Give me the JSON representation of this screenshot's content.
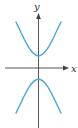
{
  "figure": {
    "type": "hyperbola",
    "orientation": "vertical",
    "equation_form": "y^2/a^2 - x^2/b^2 = 1",
    "axes": {
      "x_label": "x",
      "y_label": "y"
    },
    "colors": {
      "curve": "#4ba6d6",
      "axis": "#444444",
      "background": "#ffffff"
    },
    "branches": [
      {
        "name": "upper",
        "vertex": [
          0,
          1
        ],
        "opens": "up"
      },
      {
        "name": "lower",
        "vertex": [
          0,
          -1
        ],
        "opens": "down"
      }
    ]
  }
}
